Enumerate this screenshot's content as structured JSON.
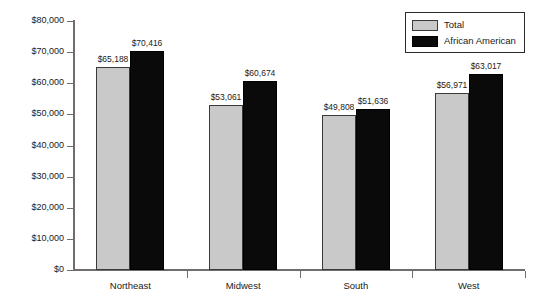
{
  "chart_data": {
    "type": "bar",
    "title": "",
    "subtitle": "",
    "xlabel": "",
    "ylabel": "",
    "categories": [
      "Northeast",
      "Midwest",
      "South",
      "West"
    ],
    "series": [
      {
        "name": "Total",
        "color": "#c9c9c9",
        "values": [
          65188,
          53061,
          49808,
          56971
        ],
        "labels": [
          "$65,188",
          "$53,061",
          "$49,808",
          "$56,971"
        ]
      },
      {
        "name": "African American",
        "color": "#0a0a0a",
        "values": [
          70416,
          60674,
          51636,
          63017
        ],
        "labels": [
          "$70,416",
          "$60,674",
          "$51,636",
          "$63,017"
        ]
      }
    ],
    "ylim": [
      0,
      80000
    ],
    "ytick_values": [
      0,
      10000,
      20000,
      30000,
      40000,
      50000,
      60000,
      70000,
      80000
    ],
    "ytick_labels": [
      "$0",
      "$10,000",
      "$20,000",
      "$30,000",
      "$40,000",
      "$50,000",
      "$60,000",
      "$70,000",
      "$80,000"
    ],
    "grid": false,
    "legend_position": "top-right",
    "legend_entries": [
      "Total",
      "African American"
    ]
  },
  "legend": {
    "items": [
      {
        "label": "Total",
        "swatch": "total-swatch"
      },
      {
        "label": "African American",
        "swatch": "african-american-swatch"
      }
    ]
  }
}
